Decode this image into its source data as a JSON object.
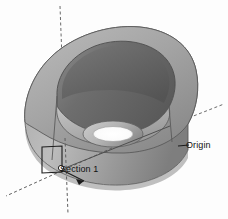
{
  "figure": {
    "kind": "3d-cad-cutaway-render",
    "background_color": "#fdfdfd"
  },
  "annotations": {
    "section_label": "Section 1",
    "origin_label": "Origin"
  },
  "axes": {
    "vertical_axis_name": "vertical-axis",
    "axis_style": "dashed",
    "axis_color": "#6a6a6a",
    "origin_marker_color": "#ffffff"
  },
  "shading": {
    "outer_light": "#b4b4b4",
    "outer_mid": "#9b9b9b",
    "outer_dark": "#7d7d7d",
    "inner_cavity": "#6f6f6f",
    "inner_cavity_dark": "#5d5d5d",
    "rim_highlight": "#c6c6c6",
    "floor_light": "#bdbdbd",
    "bore_hole": "#ffffff",
    "edge_line": "#4a4a4a"
  }
}
